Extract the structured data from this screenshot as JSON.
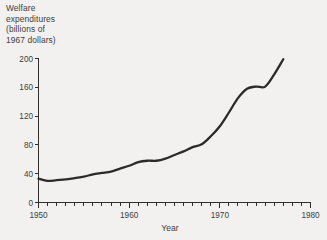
{
  "chart_data": {
    "type": "line",
    "title": "",
    "xlabel": "Year",
    "ylabel": "Welfare expenditures (billions of 1967 dollars)",
    "ylabel_lines": [
      "Welfare",
      "expenditures",
      "(billions of",
      "1967 dollars)"
    ],
    "xlim": [
      1950,
      1980
    ],
    "ylim": [
      0,
      200
    ],
    "grid": false,
    "legend": "none",
    "line_color": "#2b2b2b",
    "background_color": "#f2f1ef",
    "axis_color": "#2e2e2e",
    "x_ticks_major": [
      1950,
      1960,
      1970,
      1980
    ],
    "x_tick_labels": [
      "1950",
      "1960",
      "1970",
      "1980"
    ],
    "x_minor_tick_step": 1,
    "y_ticks": [
      0,
      40,
      80,
      120,
      160,
      200
    ],
    "y_tick_labels": [
      "0",
      "40",
      "80",
      "120",
      "160",
      "200"
    ],
    "x": [
      1950,
      1951,
      1952,
      1953,
      1954,
      1955,
      1956,
      1957,
      1958,
      1959,
      1960,
      1961,
      1962,
      1963,
      1964,
      1965,
      1966,
      1967,
      1968,
      1969,
      1970,
      1971,
      1972,
      1973,
      1974,
      1975,
      1976,
      1977
    ],
    "values": [
      33,
      30,
      31,
      32,
      34,
      36,
      39,
      41,
      43,
      47,
      51,
      56,
      58,
      58,
      61,
      66,
      71,
      77,
      81,
      92,
      106,
      125,
      145,
      158,
      161,
      161,
      178,
      199
    ],
    "series": [
      {
        "name": "Welfare expenditures",
        "values": [
          33,
          30,
          31,
          32,
          34,
          36,
          39,
          41,
          43,
          47,
          51,
          56,
          58,
          58,
          61,
          66,
          71,
          77,
          81,
          92,
          106,
          125,
          145,
          158,
          161,
          161,
          178,
          199
        ]
      }
    ]
  }
}
